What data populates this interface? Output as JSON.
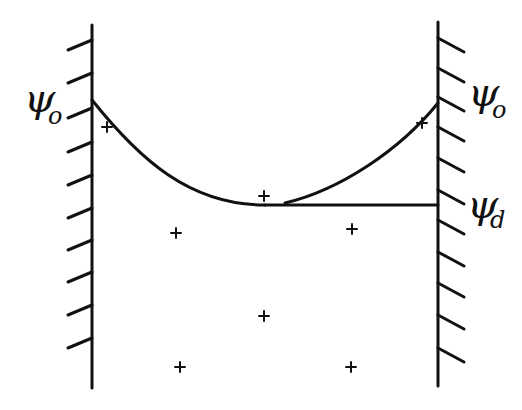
{
  "labels": {
    "left_psi0": {
      "symbol": "ψ",
      "sub": "o"
    },
    "right_psi0": {
      "symbol": "ψ",
      "sub": "o"
    },
    "right_psid": {
      "symbol": "ψ",
      "sub": "d"
    }
  },
  "colors": {
    "ink": "#111111",
    "background": "#ffffff"
  },
  "walls": {
    "left": {
      "x": 92,
      "y1": 25,
      "y2": 388,
      "hatch_side": "left",
      "hatch_ys": [
        40,
        73,
        108,
        142,
        175,
        208,
        240,
        272,
        305,
        338
      ]
    },
    "right": {
      "x": 438,
      "y1": 22,
      "y2": 386,
      "hatch_side": "right",
      "hatch_ys": [
        38,
        68,
        97,
        127,
        158,
        190,
        220,
        252,
        283,
        315,
        348
      ]
    }
  },
  "potential_curve": {
    "left_branch": "M92,100 C140,160 190,205 265,205",
    "right_branch": "M285,203 C340,190 400,150 438,103",
    "plateau": {
      "x1": 265,
      "x2": 438,
      "y": 205
    }
  },
  "crosses": [
    {
      "x": 107,
      "y": 127
    },
    {
      "x": 264,
      "y": 196
    },
    {
      "x": 422,
      "y": 123
    },
    {
      "x": 176,
      "y": 233
    },
    {
      "x": 352,
      "y": 229
    },
    {
      "x": 264,
      "y": 316
    },
    {
      "x": 180,
      "y": 367
    },
    {
      "x": 351,
      "y": 367
    }
  ]
}
